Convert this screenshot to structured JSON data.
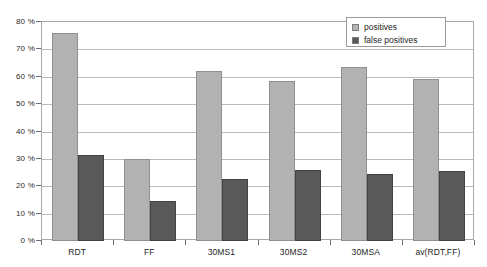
{
  "chart_data": {
    "type": "bar",
    "title": "",
    "xlabel": "",
    "ylabel": "",
    "categories": [
      "RDT",
      "FF",
      "30MS1",
      "30MS2",
      "30MSA",
      "av(RDT,FF)"
    ],
    "series": [
      {
        "name": "positives",
        "color": "#b2b2b2",
        "values": [
          76,
          30,
          62,
          58.5,
          63.5,
          59
        ]
      },
      {
        "name": "false positives",
        "color": "#595959",
        "values": [
          31.5,
          14.5,
          22.5,
          26,
          24.5,
          25.5
        ]
      }
    ],
    "ylim": [
      0,
      80
    ],
    "ytick_step": 10,
    "ytick_labels": [
      "0 %",
      "10 %",
      "20 %",
      "30 %",
      "40 %",
      "50 %",
      "60 %",
      "70 %",
      "80 %"
    ],
    "ytick_values": [
      0,
      10,
      20,
      30,
      40,
      50,
      60,
      70,
      80
    ],
    "grid": true,
    "grid_axis": "y",
    "legend_position": "top-right",
    "legend_entries": [
      "positives",
      "false positives"
    ],
    "axis_color": "#a8a8a8",
    "gridline_color": "#b9b9b9",
    "background": "#ffffff"
  }
}
